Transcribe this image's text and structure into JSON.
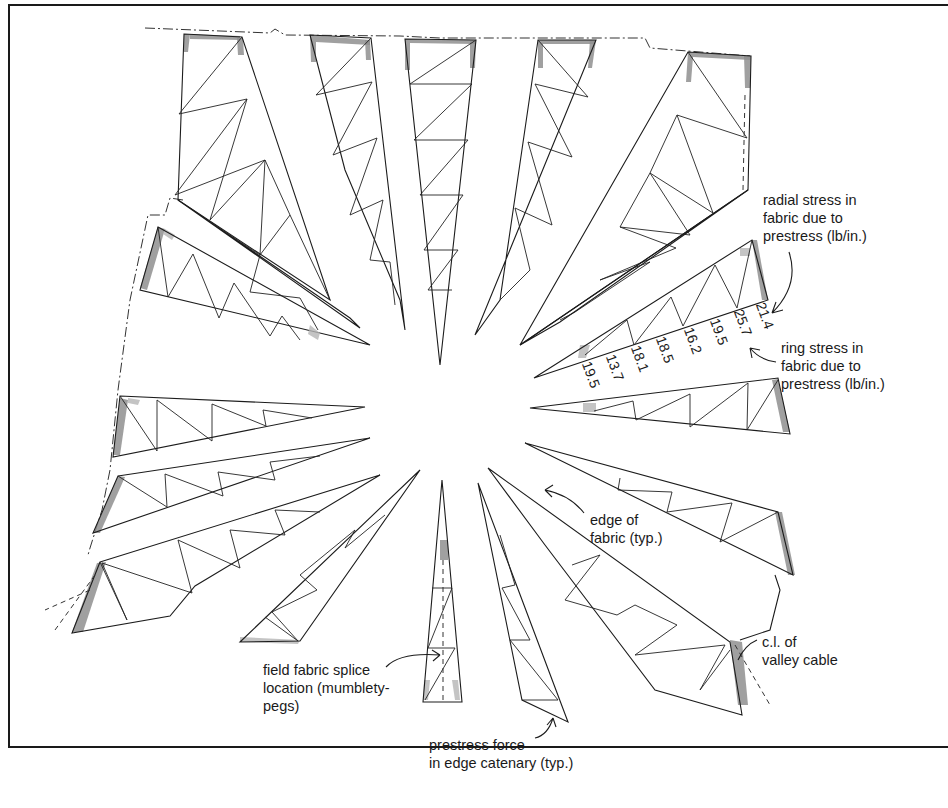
{
  "diagram": {
    "title": "",
    "type": "fabric roof cutting-pattern layout (radial panels)",
    "annotations": {
      "radial_stress": "radial stress in\nfabric due to\nprestress (lb/in.)",
      "ring_stress": "ring stress in\nfabric due to\nprestress (lb/in.)",
      "edge_of_fabric": "edge of\nfabric (typ.)",
      "valley_cable": "c.l. of\nvalley cable",
      "splice": "field fabric splice\nlocation (mumblety-\npegs)",
      "prestress_force": "prestress force\nin edge catenary (typ.)"
    },
    "stress_values": [
      "19.5",
      "13.7",
      "18.1",
      "18.5",
      "16.2",
      "19.5",
      "25.7",
      "21.4"
    ],
    "stress_units": "lb/in.",
    "colors": {
      "line": "#1c1c1c",
      "shading": "#8f8f8f",
      "background": "#ffffff"
    }
  }
}
